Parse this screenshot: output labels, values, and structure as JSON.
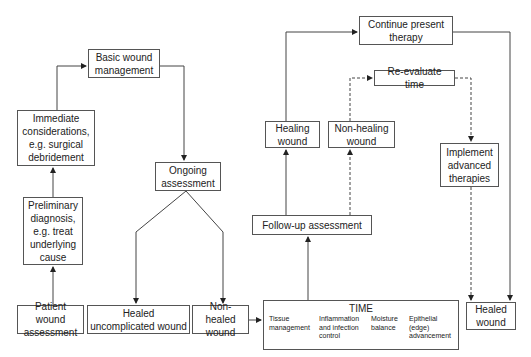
{
  "diagram": {
    "type": "flowchart",
    "nodes": {
      "patient_wound_assessment": "Patient wound assessment",
      "preliminary_diagnosis": "Preliminary diagnosis, e.g. treat underlying cause",
      "immediate_considerations": "Immediate considerations, e.g. surgical debridement",
      "basic_wound_management": "Basic wound management",
      "ongoing_assessment": "Ongoing assessment",
      "healed_uncomplicated_wound": "Healed uncomplicated wound",
      "non_healed_wound": "Non-healed wound",
      "follow_up_assessment": "Follow-up assessment",
      "healing_wound": "Healing wound",
      "non_healing_wound": "Non-healing wound",
      "continue_present_therapy": "Continue present therapy",
      "re_evaluate_time": "Re-evaluate time",
      "implement_advanced_therapies": "Implement advanced therapies",
      "healed_wound": "Healed wound"
    },
    "time_box": {
      "title": "TIME",
      "items": [
        "Tissue management",
        "Inflammation and infection control",
        "Moisture balance",
        "Epithelial (edge) advancement"
      ]
    },
    "edges": [
      {
        "from": "Patient wound assessment",
        "to": "Preliminary diagnosis",
        "style": "solid"
      },
      {
        "from": "Preliminary diagnosis",
        "to": "Immediate considerations",
        "style": "solid"
      },
      {
        "from": "Immediate considerations",
        "to": "Basic wound management",
        "style": "solid"
      },
      {
        "from": "Basic wound management",
        "to": "Ongoing assessment",
        "style": "solid"
      },
      {
        "from": "Ongoing assessment",
        "to": "Healed uncomplicated wound",
        "style": "solid"
      },
      {
        "from": "Ongoing assessment",
        "to": "Non-healed wound",
        "style": "solid"
      },
      {
        "from": "Non-healed wound",
        "to": "TIME",
        "style": "solid"
      },
      {
        "from": "TIME",
        "to": "Follow-up assessment",
        "style": "solid"
      },
      {
        "from": "Follow-up assessment",
        "to": "Healing wound",
        "style": "solid"
      },
      {
        "from": "Follow-up assessment",
        "to": "Non-healing wound",
        "style": "dashed"
      },
      {
        "from": "Healing wound",
        "to": "Continue present therapy",
        "style": "solid"
      },
      {
        "from": "Continue present therapy",
        "to": "Healed wound",
        "style": "solid"
      },
      {
        "from": "Non-healing wound",
        "to": "Re-evaluate time",
        "style": "dashed"
      },
      {
        "from": "Re-evaluate time",
        "to": "Implement advanced therapies",
        "style": "dashed"
      },
      {
        "from": "Implement advanced therapies",
        "to": "Healed wound",
        "style": "dashed"
      }
    ],
    "colors": {
      "line": "#444444",
      "border": "#555555",
      "text": "#222222",
      "background": "#ffffff"
    }
  }
}
